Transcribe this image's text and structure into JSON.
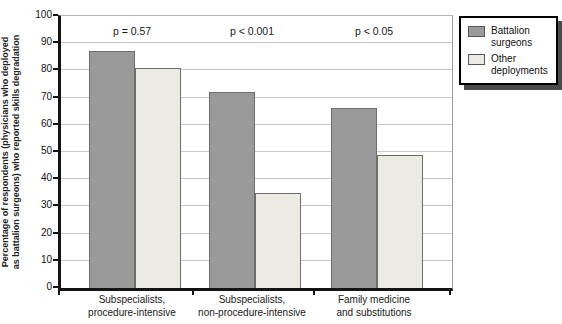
{
  "chart_data": {
    "type": "bar",
    "title": "",
    "ylabel_lines": [
      "Percentage of respondents (physicians who deployed",
      "as battalion surgeons) who reported skills degradation"
    ],
    "categories": [
      [
        "Subspecialists,",
        "procedure-intensive"
      ],
      [
        "Subspecialists,",
        "non-procedure-intensive"
      ],
      [
        "Family medicine",
        "and substitutions"
      ]
    ],
    "series": [
      {
        "name": "Battalion surgeons",
        "color": "#9a9a9a",
        "values": [
          87,
          72,
          66
        ]
      },
      {
        "name": "Other deployments",
        "color": "#ecebe3",
        "values": [
          81,
          35,
          49
        ]
      }
    ],
    "annotations": [
      "p = 0.57",
      "p < 0.001",
      "p < 0.05"
    ],
    "ylim": [
      0,
      100
    ],
    "ytick_step": 10,
    "grid": "horizontal",
    "legend_position": "top-right",
    "colors": {
      "axis": "#141414",
      "gridline": "#cbcbcb",
      "bar_border": "#6e6e6e",
      "legend_shadow": "#4a4a4a"
    }
  }
}
